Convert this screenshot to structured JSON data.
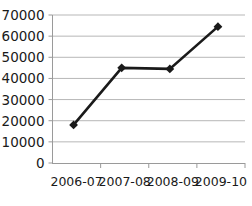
{
  "chart_data": {
    "type": "line",
    "title": "",
    "subtitle": "",
    "xlabel": "",
    "ylabel": "",
    "categories": [
      "2006-07",
      "2007-08",
      "2008-09",
      "2009-10"
    ],
    "values": [
      18000,
      45000,
      44500,
      64500
    ],
    "series": [
      {
        "name": "",
        "values": [
          18000,
          45000,
          44500,
          64500
        ]
      }
    ],
    "ylim": [
      0,
      70000
    ],
    "yticks": [
      0,
      10000,
      20000,
      30000,
      40000,
      50000,
      60000,
      70000
    ],
    "ytick_labels": [
      "0",
      "10000",
      "20000",
      "30000",
      "40000",
      "50000",
      "60000",
      "70000"
    ],
    "xtick_labels": [
      "2006-07",
      "2007-08",
      "2008-09",
      "2009-10"
    ],
    "grid": true,
    "grid_axis": "y",
    "legend": false,
    "legend_position": "none",
    "annotations": [],
    "marker": "diamond",
    "colors": {
      "line": "#1a1a1a",
      "marker": "#1a1a1a",
      "grid": "#b7b7b7",
      "axis": "#9a9a9a",
      "text": "#1a1a1a",
      "background": "#ffffff"
    }
  },
  "axes": {
    "y_axis_name": "value-axis",
    "x_axis_name": "category-axis"
  }
}
